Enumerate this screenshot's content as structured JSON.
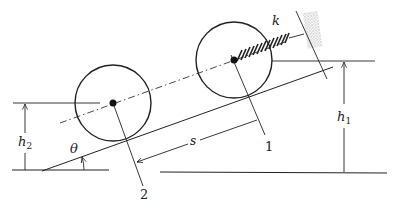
{
  "diagram": {
    "type": "mechanics-figure",
    "labels": {
      "spring_constant": "k",
      "height_1": "h",
      "height_1_sub": "1",
      "height_2": "h",
      "height_2_sub": "2",
      "angle": "θ",
      "displacement": "s",
      "position_1": "1",
      "position_2": "2"
    },
    "colors": {
      "line": "#222222",
      "stipple": "#b8b8b8"
    }
  }
}
